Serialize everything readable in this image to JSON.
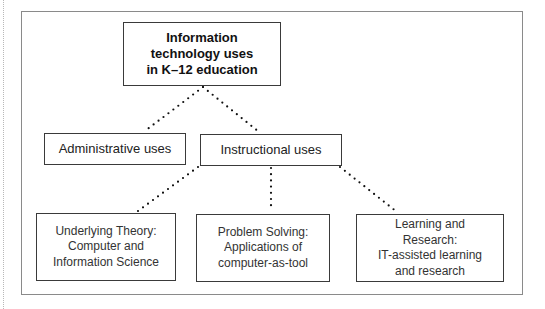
{
  "diagram": {
    "root": {
      "lines": [
        "Information",
        "technology uses",
        "in K–12 education"
      ]
    },
    "level1": [
      {
        "id": "administrative",
        "lines": [
          "Administrative uses"
        ]
      },
      {
        "id": "instructional",
        "lines": [
          "Instructional uses"
        ]
      }
    ],
    "level2": [
      {
        "id": "theory",
        "parent": "instructional",
        "lines": [
          "Underlying Theory:",
          "Computer and",
          "Information Science"
        ]
      },
      {
        "id": "problem-solving",
        "parent": "instructional",
        "lines": [
          "Problem Solving:",
          "Applications of",
          "computer-as-tool"
        ]
      },
      {
        "id": "learning-research",
        "parent": "instructional",
        "lines": [
          "Learning and",
          "Research:",
          "IT-assisted learning",
          "and research"
        ]
      }
    ],
    "connector_style": "dotted"
  }
}
